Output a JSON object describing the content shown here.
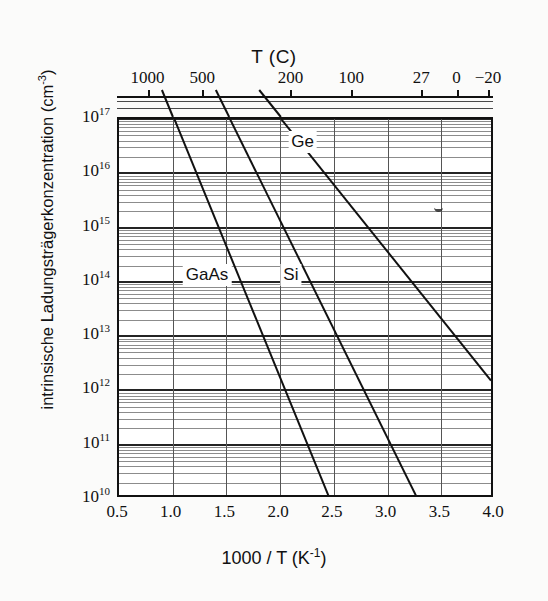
{
  "chart_data": {
    "type": "line",
    "title": "T (C)",
    "xlabel": "1000 / T (K⁻¹)",
    "ylabel": "intrinsische Ladungsträgerkonzentration  (cm⁻³)",
    "yscale": "log",
    "xlim": [
      0.5,
      4.0
    ],
    "ylim": [
      10000000000.0,
      1e+17
    ],
    "grid": true,
    "legend": "inline-labels",
    "x_ticks": [
      0.5,
      1.0,
      1.5,
      2.0,
      2.5,
      3.0,
      3.5,
      4.0
    ],
    "x_tick_labels": [
      "0.5",
      "1.0",
      "1.5",
      "2.0",
      "2.5",
      "3.0",
      "3.5",
      "4.0"
    ],
    "y_ticks": [
      10000000000.0,
      100000000000.0,
      1000000000000.0,
      10000000000000.0,
      100000000000000.0,
      1000000000000000.0,
      1e+16,
      1e+17
    ],
    "y_tick_labels": [
      "10",
      "10",
      "10",
      "10",
      "10",
      "10",
      "10",
      "10"
    ],
    "y_tick_exponents": [
      "10",
      "11",
      "12",
      "13",
      "14",
      "15",
      "16",
      "17"
    ],
    "secondary_axis": {
      "label": "T (C)",
      "unit": "C",
      "ticks_celsius": [
        1000,
        500,
        200,
        100,
        27,
        0,
        -20
      ],
      "tick_labels": [
        "1000",
        "500",
        "200",
        "100",
        "27",
        "0",
        "−20"
      ],
      "ticks_x": [
        0.785,
        1.294,
        2.114,
        2.681,
        3.333,
        3.661,
        3.953
      ]
    },
    "series": [
      {
        "name": "Ge",
        "label": "Ge",
        "label_x": 2.21,
        "label_y": 3.8e+16,
        "points": [
          {
            "x": 1.71,
            "y": 6e+17
          },
          {
            "x": 4.0,
            "y": 1350000000000.0
          }
        ]
      },
      {
        "name": "Si",
        "label": "Si",
        "label_x": 2.1,
        "label_y": 135000000000000.0,
        "points": [
          {
            "x": 1.35,
            "y": 6e+17
          },
          {
            "x": 3.33,
            "y": 7000000000.0
          }
        ]
      },
      {
        "name": "GaAs",
        "label": "GaAs",
        "label_x": 1.32,
        "label_y": 135000000000000.0,
        "points": [
          {
            "x": 0.86,
            "y": 6e+17
          },
          {
            "x": 2.5,
            "y": 7000000000.0
          }
        ]
      }
    ]
  },
  "axes": {
    "top_title": "T (C)",
    "x_title_main": "1000 / T (K",
    "x_title_sup": "-1",
    "x_title_tail": ")",
    "y_title_main": "intrinsische Ladungsträgerkonzentration  (cm",
    "y_title_sup": "-3",
    "y_title_tail": ")"
  }
}
